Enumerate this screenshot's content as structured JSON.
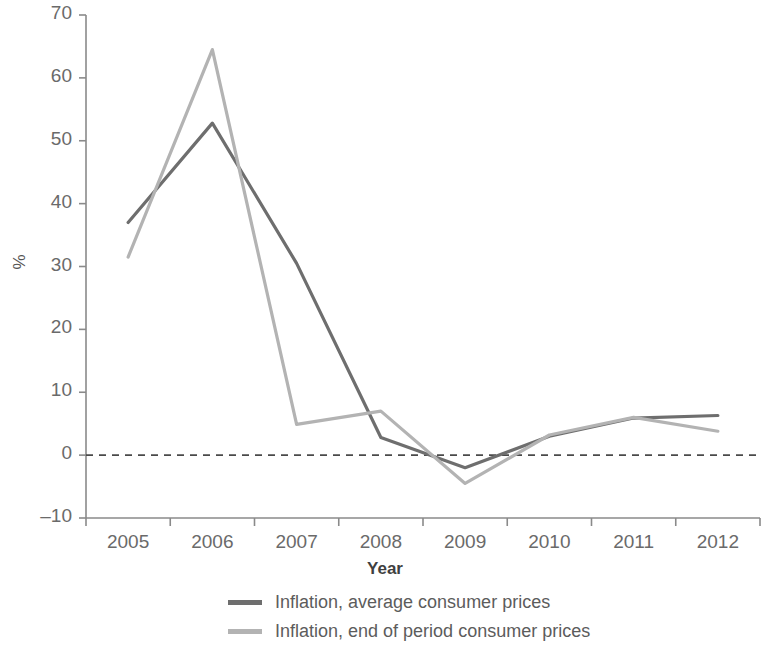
{
  "chart_data": {
    "type": "line",
    "title": "",
    "xlabel": "Year",
    "ylabel": "%",
    "categories": [
      "2005",
      "2006",
      "2007",
      "2008",
      "2009",
      "2010",
      "2011",
      "2012"
    ],
    "x": [
      2005,
      2006,
      2007,
      2008,
      2009,
      2010,
      2011,
      2012
    ],
    "xlim": [
      2004.5,
      2012.5
    ],
    "ylim": [
      -10,
      70
    ],
    "yticks": [
      70,
      60,
      50,
      40,
      30,
      20,
      10,
      0,
      -10
    ],
    "ytick_labels": [
      "70",
      "60",
      "50",
      "40",
      "30",
      "20",
      "10",
      "0",
      "–10"
    ],
    "grid": false,
    "legend_position": "bottom",
    "reference_lines": [
      {
        "name": "zero-line",
        "y": 0,
        "style": "dashed",
        "color": "#4a4a4a"
      }
    ],
    "series": [
      {
        "name": "Inflation, average consumer prices",
        "color": "#6e6e6e",
        "values": [
          37.0,
          52.8,
          30.5,
          2.8,
          -2.0,
          3.0,
          5.9,
          6.3
        ]
      },
      {
        "name": "Inflation, end of period consumer prices",
        "color": "#b3b3b3",
        "values": [
          31.5,
          64.5,
          4.9,
          7.0,
          -4.5,
          3.2,
          6.0,
          3.8
        ]
      }
    ]
  },
  "axes": {
    "y_label": "%",
    "x_label": "Year",
    "y_tick_labels": [
      "70",
      "60",
      "50",
      "40",
      "30",
      "20",
      "10",
      "0",
      "–10"
    ],
    "x_tick_labels": [
      "2005",
      "2006",
      "2007",
      "2008",
      "2009",
      "2010",
      "2011",
      "2012"
    ]
  },
  "legend": {
    "entries": [
      {
        "label": "Inflation, average consumer prices",
        "color": "#6e6e6e"
      },
      {
        "label": "Inflation, end of period consumer prices",
        "color": "#b3b3b3"
      }
    ]
  }
}
